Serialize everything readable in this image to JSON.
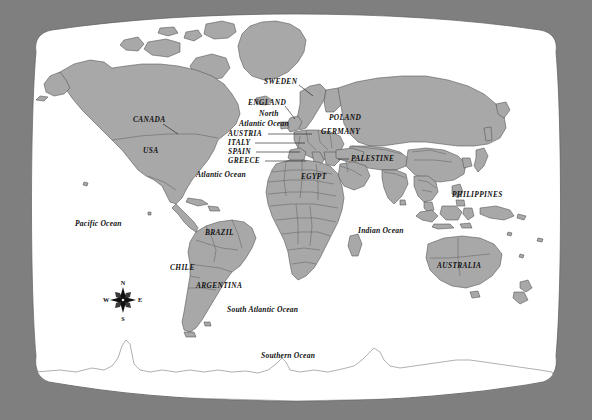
{
  "page": {
    "width": 592,
    "height": 420,
    "background_color": "#7f7f7f",
    "map_sheet_color": "#ffffff",
    "land_fill_color": "#a8a8a8",
    "land_border_color": "#5c5c5c",
    "coast_line_color": "#4a4a4a",
    "antarctica_fill_color": "#ffffff",
    "label_color": "#111111"
  },
  "map": {
    "projection": "Robinson",
    "sheet": {
      "left": 34,
      "top": 14,
      "right": 558,
      "bottom": 404
    }
  },
  "country_labels": [
    {
      "name": "CANADA",
      "text": "CANADA",
      "x": 133,
      "y": 122,
      "anchor": "start",
      "leader": {
        "x1": 163,
        "y1": 124,
        "x2": 178,
        "y2": 134
      }
    },
    {
      "name": "USA",
      "text": "USA",
      "x": 143,
      "y": 153,
      "anchor": "start",
      "leader": null
    },
    {
      "name": "SWEDEN",
      "text": "SWEDEN",
      "x": 264,
      "y": 84,
      "anchor": "start",
      "leader": {
        "x1": 299,
        "y1": 85,
        "x2": 313,
        "y2": 96
      }
    },
    {
      "name": "ENGLAND",
      "text": "ENGLAND",
      "x": 248,
      "y": 105,
      "anchor": "start",
      "leader": {
        "x1": 285,
        "y1": 106,
        "x2": 295,
        "y2": 119
      }
    },
    {
      "name": "POLAND",
      "text": "POLAND",
      "x": 329,
      "y": 120,
      "anchor": "start",
      "leader": null
    },
    {
      "name": "GERMANY",
      "text": "GERMANY",
      "x": 321,
      "y": 134,
      "anchor": "start",
      "leader": null
    },
    {
      "name": "AUSTRIA",
      "text": "AUSTRIA",
      "x": 228,
      "y": 136,
      "anchor": "start",
      "leader": {
        "x1": 268,
        "y1": 134,
        "x2": 312,
        "y2": 134
      }
    },
    {
      "name": "ITALY",
      "text": "ITALY",
      "x": 228,
      "y": 145,
      "anchor": "start",
      "leader": {
        "x1": 255,
        "y1": 143,
        "x2": 305,
        "y2": 143
      }
    },
    {
      "name": "SPAIN",
      "text": "SPAIN",
      "x": 228,
      "y": 154,
      "anchor": "start",
      "leader": {
        "x1": 256,
        "y1": 152,
        "x2": 300,
        "y2": 152
      }
    },
    {
      "name": "GREECE",
      "text": "GREECE",
      "x": 228,
      "y": 163,
      "anchor": "start",
      "leader": {
        "x1": 265,
        "y1": 161,
        "x2": 306,
        "y2": 161
      }
    },
    {
      "name": "PALESTINE",
      "text": "PALESTINE",
      "x": 351,
      "y": 161,
      "anchor": "start",
      "leader": {
        "x1": 338,
        "y1": 159,
        "x2": 348,
        "y2": 159
      }
    },
    {
      "name": "EGYPT",
      "text": "EGYPT",
      "x": 301,
      "y": 179,
      "anchor": "start",
      "leader": null
    },
    {
      "name": "BRAZIL",
      "text": "BRAZIL",
      "x": 205,
      "y": 235,
      "anchor": "start",
      "leader": null
    },
    {
      "name": "CHILE",
      "text": "CHILE",
      "x": 170,
      "y": 270,
      "anchor": "start",
      "leader": null
    },
    {
      "name": "ARGENTINA",
      "text": "ARGENTINA",
      "x": 196,
      "y": 288,
      "anchor": "start",
      "leader": null
    },
    {
      "name": "PHILIPPINES",
      "text": "PHILIPPINES",
      "x": 452,
      "y": 197,
      "anchor": "start",
      "leader": null
    },
    {
      "name": "AUSTRALIA",
      "text": "AUSTRALIA",
      "x": 437,
      "y": 268,
      "anchor": "start",
      "leader": null
    }
  ],
  "ocean_labels": [
    {
      "name": "north-atlantic-ocean-line1",
      "text": "North",
      "x": 259,
      "y": 116,
      "anchor": "start"
    },
    {
      "name": "north-atlantic-ocean-line2",
      "text": "Atlantic Ocean",
      "x": 239,
      "y": 126,
      "anchor": "start"
    },
    {
      "name": "atlantic-ocean",
      "text": "Atlantic Ocean",
      "x": 196,
      "y": 177,
      "anchor": "start"
    },
    {
      "name": "pacific-ocean",
      "text": "Pacific Ocean",
      "x": 75,
      "y": 226,
      "anchor": "start"
    },
    {
      "name": "indian-ocean",
      "text": "Indian Ocean",
      "x": 358,
      "y": 233,
      "anchor": "start"
    },
    {
      "name": "south-atlantic-ocean",
      "text": "South Atlantic Ocean",
      "x": 227,
      "y": 312,
      "anchor": "start"
    },
    {
      "name": "southern-ocean",
      "text": "Southern Ocean",
      "x": 261,
      "y": 358,
      "anchor": "start"
    }
  ],
  "compass": {
    "name": "compass-rose",
    "center_x": 123,
    "center_y": 300,
    "radius": 13,
    "north_label": "N",
    "south_label": "S",
    "east_label": "E",
    "west_label": "W"
  }
}
